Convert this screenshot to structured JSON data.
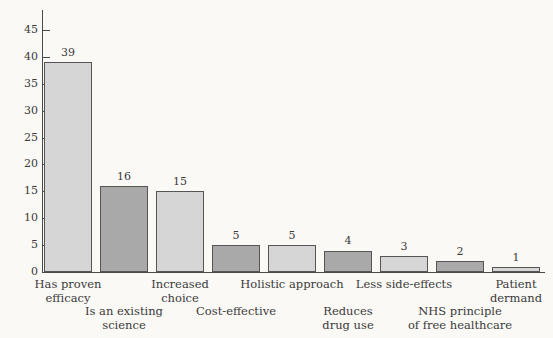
{
  "chart_data": {
    "type": "bar",
    "title": "",
    "subtitle": "",
    "xlabel": "",
    "ylabel": "",
    "ylim": [
      0,
      45
    ],
    "grid": false,
    "legend": "none",
    "y_ticks": [
      0,
      5,
      10,
      15,
      20,
      25,
      30,
      35,
      40,
      45
    ],
    "categories": [
      "Has proven\nefficacy",
      "Is an existing\nscience",
      "Increased\nchoice",
      "Cost-effective",
      "Holistic approach",
      "Reduces\ndrug use",
      "Less side-effects",
      "NHS principle\nof free healthcare",
      "Patient\ndermand"
    ],
    "values": [
      39,
      16,
      15,
      5,
      5,
      4,
      3,
      2,
      1
    ],
    "value_labels": [
      "39",
      "16",
      "15",
      "5",
      "5",
      "4",
      "3",
      "2",
      "1"
    ],
    "bar_shades": [
      "light",
      "dark",
      "light",
      "dark",
      "light",
      "dark",
      "light",
      "dark",
      "light"
    ],
    "label_rows": [
      0,
      1,
      0,
      1,
      0,
      1,
      0,
      1,
      0
    ]
  },
  "colors": {
    "background": "#faf9f6",
    "bar_light": "#d6d6d6",
    "bar_dark": "#a9a9a9",
    "bar_border": "#555555",
    "axis": "#4a4a4a",
    "text": "#3a3a3a"
  }
}
